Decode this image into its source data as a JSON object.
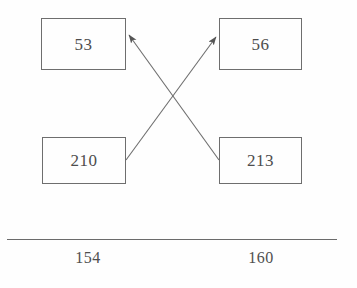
{
  "diagram": {
    "type": "crossing-mapping-diagram",
    "background_color": "#fefefe",
    "stroke_color": "#6e6e6e",
    "text_color": "#4d4d4d",
    "nodes": [
      {
        "id": "top-left",
        "label": "53",
        "x": 41,
        "y": 18,
        "w": 85,
        "h": 52
      },
      {
        "id": "top-right",
        "label": "56",
        "x": 219,
        "y": 18,
        "w": 83,
        "h": 52
      },
      {
        "id": "bottom-left",
        "label": "210",
        "x": 42,
        "y": 137,
        "w": 84,
        "h": 47
      },
      {
        "id": "bottom-right",
        "label": "213",
        "x": 219,
        "y": 137,
        "w": 83,
        "h": 47
      }
    ],
    "edges": [
      {
        "id": "edge-210-to-56",
        "from": "bottom-left",
        "to": "top-right",
        "x1": 126,
        "y1": 160,
        "x2": 217,
        "y2": 36,
        "arrowhead": "end"
      },
      {
        "id": "edge-213-to-53",
        "from": "bottom-right",
        "to": "top-left",
        "x1": 219,
        "y1": 160,
        "x2": 128,
        "y2": 34,
        "arrowhead": "end"
      }
    ],
    "crossing_point": {
      "x": 172,
      "y": 99
    },
    "rule": {
      "x": 7,
      "y": 239,
      "width": 330
    },
    "axis_labels": [
      {
        "id": "axis-label-left",
        "text": "154",
        "center_x": 88,
        "y": 250
      },
      {
        "id": "axis-label-right",
        "text": "160",
        "center_x": 261,
        "y": 250
      }
    ]
  }
}
